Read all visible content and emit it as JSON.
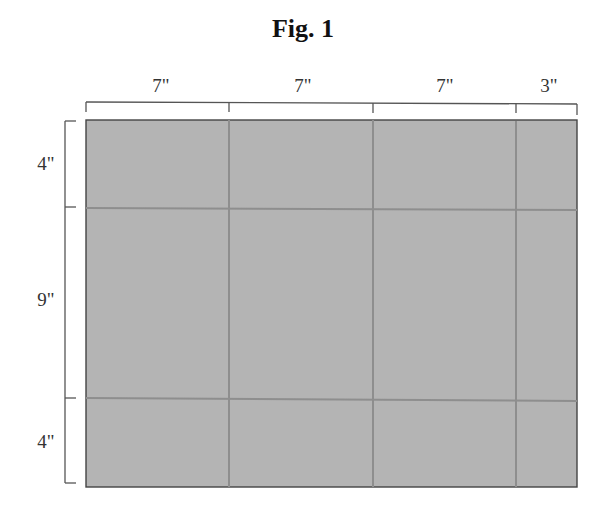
{
  "figure": {
    "title": "Fig. 1"
  },
  "dimensions": {
    "columns": [
      {
        "label": "7\"",
        "inches": 7
      },
      {
        "label": "7\"",
        "inches": 7
      },
      {
        "label": "7\"",
        "inches": 7
      },
      {
        "label": "3\"",
        "inches": 3
      }
    ],
    "rows": [
      {
        "label": "4\"",
        "inches": 4
      },
      {
        "label": "9\"",
        "inches": 9
      },
      {
        "label": "4\"",
        "inches": 4
      }
    ]
  },
  "colors": {
    "panel_fill": "#b4b4b4",
    "grid_line": "#8e8e8e",
    "outline": "#444444",
    "bracket": "#555555"
  }
}
